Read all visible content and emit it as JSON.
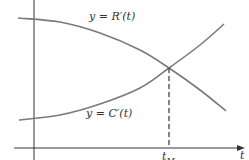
{
  "chart_data": {
    "type": "line",
    "title": "",
    "xlabel": "t",
    "ylabel": "",
    "grid": false,
    "legend": "none (curves labeled inline)",
    "annotations": [
      {
        "text": "y = R'(t)",
        "attached_to": "R'"
      },
      {
        "text": "y = C'(t)",
        "attached_to": "C'"
      },
      {
        "text": "t_M",
        "meaning": "t at which R'(t) = C'(t); marked by dashed vertical line"
      }
    ],
    "x_ticks": [
      "t_M"
    ],
    "series": [
      {
        "name": "R'(t)",
        "label": "y = R'(t)",
        "trend": "decreasing, concave down",
        "points_px": [
          [
            18,
            18
          ],
          [
            60,
            22
          ],
          [
            100,
            33
          ],
          [
            140,
            50
          ],
          [
            169,
            68
          ],
          [
            200,
            90
          ],
          [
            226,
            111
          ]
        ]
      },
      {
        "name": "C'(t)",
        "label": "y = C'(t)",
        "trend": "increasing, concave up",
        "points_px": [
          [
            19,
            120
          ],
          [
            60,
            115
          ],
          [
            100,
            104
          ],
          [
            140,
            88
          ],
          [
            169,
            68
          ],
          [
            200,
            45
          ],
          [
            224,
            24
          ]
        ]
      }
    ],
    "intersection_px": [
      169,
      68
    ],
    "colors": {
      "curves": "#7a7a7a",
      "axes": "#333333",
      "dashed": "#333333"
    }
  },
  "labels": {
    "r_curve": "y = R′(t)",
    "c_curve": "y = C′(t)",
    "t_m_base": "t",
    "t_m_sub": "M",
    "x_axis": "t"
  }
}
